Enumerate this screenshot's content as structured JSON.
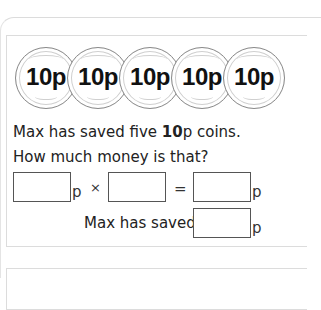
{
  "coins": {
    "label": "10p",
    "count": 5,
    "items": [
      "10p",
      "10p",
      "10p",
      "10p",
      "10p"
    ]
  },
  "question": {
    "line1_prefix": "Max has saved five ",
    "line1_bold": "10",
    "line1_suffix": "p coins.",
    "line2": "How much money is that?"
  },
  "equation": {
    "unit1": "p",
    "times": "×",
    "equals": "=",
    "unit2": "p",
    "box1_value": "",
    "box2_value": "",
    "box3_value": ""
  },
  "answer": {
    "label": "Max has saved",
    "unit": "p",
    "box_value": ""
  }
}
